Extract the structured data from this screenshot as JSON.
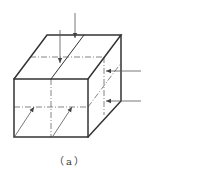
{
  "figure": {
    "caption": "（a）",
    "colors": {
      "edge": "#333333",
      "center_line": "#666666",
      "arrow": "#555555",
      "background": "#ffffff"
    },
    "cube": {
      "front_face": {
        "x1": 14,
        "y1": 79,
        "x2": 88,
        "y2": 137
      },
      "depth_offset": {
        "dx": 33,
        "dy": -44
      }
    },
    "arrows": [
      {
        "face": "top",
        "from": [
          75,
          13
        ],
        "to": [
          75,
          38
        ]
      },
      {
        "face": "top",
        "from": [
          60,
          30
        ],
        "to": [
          60,
          63
        ]
      },
      {
        "face": "right",
        "from": [
          141,
          71
        ],
        "to": [
          106,
          71
        ]
      },
      {
        "face": "right",
        "from": [
          141,
          101
        ],
        "to": [
          106,
          101
        ]
      },
      {
        "face": "front",
        "from": [
          15,
          136
        ],
        "to": [
          34,
          107
        ]
      },
      {
        "face": "front",
        "from": [
          53,
          136
        ],
        "to": [
          72,
          107
        ]
      }
    ]
  }
}
